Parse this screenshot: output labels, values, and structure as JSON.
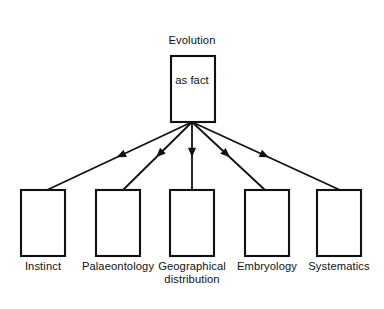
{
  "diagram": {
    "type": "hierarchy-tree",
    "orientation": "top-down",
    "background_color": "#ffffff",
    "line_color": "#111111",
    "text_color": "#111111",
    "root": {
      "title_line_1": "Evolution",
      "title_line_2": "as fact",
      "title_full": "Evolution as fact",
      "box": {
        "x": 171,
        "y": 56,
        "width": 44,
        "height": 66
      }
    },
    "connector": {
      "count": 5,
      "origin": {
        "x": 192,
        "y": 122
      },
      "arrowhead_style": "solid-filled-triangle",
      "arrowhead_position": "midpoint"
    },
    "leaves": [
      {
        "label_line_1": "Instinct",
        "label_line_2": "",
        "label_full": "Instinct",
        "box": {
          "x": 21,
          "y": 190,
          "width": 44,
          "height": 66
        },
        "target": {
          "x": 47,
          "y": 190
        }
      },
      {
        "label_line_1": "Palaeontology",
        "label_line_2": "",
        "label_full": "Palaeontology",
        "box": {
          "x": 96,
          "y": 190,
          "width": 44,
          "height": 66
        },
        "target": {
          "x": 123,
          "y": 190
        }
      },
      {
        "label_line_1": "Geographical",
        "label_line_2": "distribution",
        "label_full": "Geographical distribution",
        "box": {
          "x": 170,
          "y": 190,
          "width": 44,
          "height": 66
        },
        "target": {
          "x": 192,
          "y": 190
        }
      },
      {
        "label_line_1": "Embryology",
        "label_line_2": "",
        "label_full": "Embryology",
        "box": {
          "x": 245,
          "y": 190,
          "width": 44,
          "height": 66
        },
        "target": {
          "x": 265,
          "y": 190
        }
      },
      {
        "label_line_1": "Systematics",
        "label_line_2": "",
        "label_full": "Systematics",
        "box": {
          "x": 317,
          "y": 190,
          "width": 44,
          "height": 66
        },
        "target": {
          "x": 340,
          "y": 190
        }
      }
    ]
  }
}
